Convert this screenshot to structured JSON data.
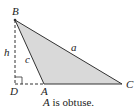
{
  "figure": {
    "vertices": {
      "B": {
        "label": "B"
      },
      "A": {
        "label": "A"
      },
      "C": {
        "label": "C"
      },
      "D": {
        "label": "D"
      }
    },
    "sides": {
      "a": "a",
      "c": "c",
      "h": "h"
    },
    "caption": {
      "italic_part": "A",
      "rest": " is obtuse."
    },
    "colors": {
      "fill": "#d9d9d9",
      "stroke": "#333333"
    }
  }
}
